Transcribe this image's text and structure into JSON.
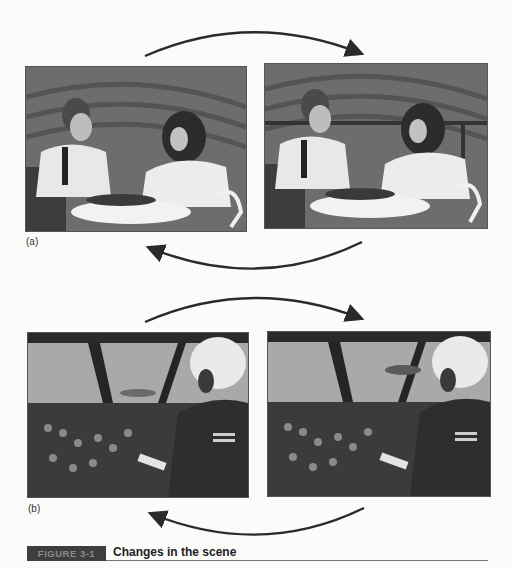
{
  "figure": {
    "number_label": "FIGURE 3-1",
    "caption": "Changes in the scene"
  },
  "panels": [
    {
      "label": "(a)",
      "scene": "couple-at-table-in-vineyard",
      "images": [
        {
          "position": "left",
          "description": "Man and woman seated at round outdoor table with wine bottle, vineyard rows behind, no railing visible"
        },
        {
          "position": "right",
          "description": "Same scene with railing across background behind the couple"
        }
      ],
      "arrows": [
        {
          "direction": "left-to-right",
          "placement": "top"
        },
        {
          "direction": "right-to-left",
          "placement": "bottom"
        }
      ]
    },
    {
      "label": "(b)",
      "scene": "aircraft-cockpit-with-pilot",
      "images": [
        {
          "position": "left",
          "description": "Cockpit view with pilot in helmet, aircraft visible low through windshield"
        },
        {
          "position": "right",
          "description": "Same cockpit with aircraft visible higher in windshield"
        }
      ],
      "arrows": [
        {
          "direction": "left-to-right",
          "placement": "top"
        },
        {
          "direction": "right-to-left",
          "placement": "bottom"
        }
      ]
    }
  ]
}
